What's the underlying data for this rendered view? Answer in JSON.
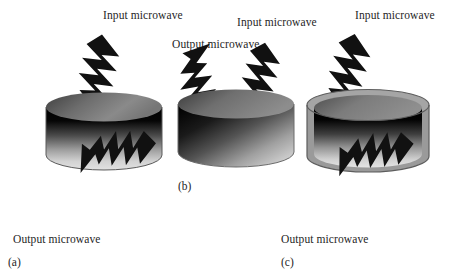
{
  "figure": {
    "background_color": "#ffffff",
    "arrow_color": "#111111",
    "width": 453,
    "height": 280
  },
  "panels": [
    {
      "id": "a",
      "letter": "(a)",
      "letter_x": 8,
      "letter_y": 256,
      "cylinder": {
        "name": "cylinder-sample-a",
        "x": 44,
        "y": 93,
        "width": 118,
        "height": 85,
        "shell": false,
        "body_gradient": "vertical-black-to-light",
        "top_gradient": "horizontal-dark-to-mid"
      },
      "arrows": [
        {
          "name": "input-microwave-arrow-a",
          "kind": "input",
          "label": "Input microwave",
          "label_x": 103,
          "label_y": 9,
          "x": 85,
          "y": 33,
          "rotation": 52,
          "length": 86,
          "thickness": 26
        },
        {
          "name": "output-microwave-arrow-a",
          "kind": "output",
          "label": "Output microwave",
          "label_x": 13,
          "label_y": 233,
          "x": 60,
          "y": 176,
          "rotation": 128,
          "length": 74,
          "thickness": 24
        }
      ]
    },
    {
      "id": "b",
      "letter": "(b)",
      "letter_x": 178,
      "letter_y": 180,
      "cylinder": {
        "name": "cylinder-sample-b",
        "x": 176,
        "y": 90,
        "width": 118,
        "height": 85,
        "shell": false,
        "body_gradient": "diagonal-dark-to-light",
        "top_gradient": "horizontal-dark-to-mid"
      },
      "arrows": [
        {
          "name": "input-microwave-arrow-b",
          "kind": "input",
          "label": "Input microwave",
          "label_x": 237,
          "label_y": 16,
          "x": 250,
          "y": 40,
          "rotation": 55,
          "length": 80,
          "thickness": 25
        },
        {
          "name": "output-microwave-arrow-b",
          "kind": "output",
          "label": "Output microwave",
          "label_x": 172,
          "label_y": 38,
          "x": 188,
          "y": 54,
          "rotation": -55,
          "length": 74,
          "thickness": 24
        }
      ]
    },
    {
      "id": "c",
      "letter": "(c)",
      "letter_x": 281,
      "letter_y": 256,
      "cylinder": {
        "name": "cylinder-sample-c",
        "x": 305,
        "y": 90,
        "width": 124,
        "height": 90,
        "shell": true,
        "shell_color": "#9a9a9a",
        "body_gradient": "vertical-black-to-light",
        "top_gradient": "horizontal-dark-to-mid"
      },
      "arrows": [
        {
          "name": "input-microwave-arrow-c",
          "kind": "input",
          "label": "Input microwave",
          "label_x": 355,
          "label_y": 9,
          "x": 337,
          "y": 32,
          "rotation": 56,
          "length": 84,
          "thickness": 26
        },
        {
          "name": "output-microwave-arrow-c",
          "kind": "output",
          "label": "Output microwave",
          "label_x": 281,
          "label_y": 233,
          "x": 319,
          "y": 178,
          "rotation": 126,
          "length": 72,
          "thickness": 24
        }
      ]
    }
  ]
}
